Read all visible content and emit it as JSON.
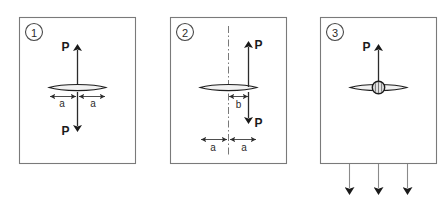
{
  "figure": {
    "background_color": "#ffffff",
    "frame_color": "#7a7a7a",
    "ink_color": "#1f1f1f"
  },
  "panels": [
    {
      "id": "panel-1",
      "badge": "1",
      "description": "Collinear opposing forces through the centroid with symmetric half-widths",
      "labels": {
        "force_top": "P",
        "force_bottom": "P",
        "dim_left": "a",
        "dim_right": "a"
      },
      "arrows": [
        {
          "name": "force-up",
          "direction": "up",
          "label": "P"
        },
        {
          "name": "force-down",
          "direction": "down",
          "label": "P"
        },
        {
          "name": "dim-left",
          "direction": "horizontal",
          "label": "a"
        },
        {
          "name": "dim-right",
          "direction": "horizontal",
          "label": "a"
        }
      ]
    },
    {
      "id": "panel-2",
      "badge": "2",
      "description": "Offset opposing forces at eccentricity b from the vertical centerline",
      "labels": {
        "force_top": "P",
        "force_bottom": "P",
        "dim_offset": "b",
        "dim_left": "a",
        "dim_right": "a"
      },
      "arrows": [
        {
          "name": "force-up",
          "direction": "up",
          "label": "P"
        },
        {
          "name": "force-down",
          "direction": "down",
          "label": "P"
        },
        {
          "name": "dim-offset",
          "direction": "horizontal",
          "label": "b"
        },
        {
          "name": "dim-left",
          "direction": "horizontal",
          "label": "a"
        },
        {
          "name": "dim-right",
          "direction": "horizontal",
          "label": "a"
        }
      ],
      "centerline": {
        "name": "vertical-centerline",
        "style": "dash-dot"
      }
    },
    {
      "id": "panel-3",
      "badge": "3",
      "description": "Single upward force on a pinned hub balanced by distributed downward reactions",
      "labels": {
        "force_top": "P"
      },
      "arrows": [
        {
          "name": "force-up",
          "direction": "up",
          "label": "P"
        },
        {
          "name": "reaction-left",
          "direction": "down",
          "label": ""
        },
        {
          "name": "reaction-center",
          "direction": "down",
          "label": ""
        },
        {
          "name": "reaction-right",
          "direction": "down",
          "label": ""
        }
      ],
      "hub": {
        "name": "pin-hub",
        "shape": "circle"
      }
    }
  ]
}
